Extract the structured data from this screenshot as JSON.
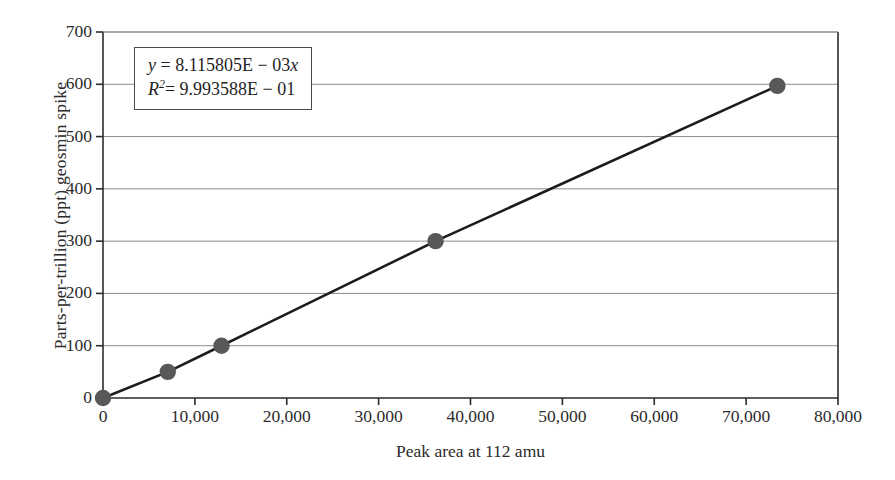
{
  "chart_data": {
    "type": "scatter",
    "title": "",
    "subtitle": "",
    "xlabel": "Peak area at 112 amu",
    "ylabel": "Parts-per-trillion (ppt) geosmin spike",
    "xlim": [
      0,
      80000
    ],
    "ylim": [
      0,
      700
    ],
    "x_ticks": [
      0,
      10000,
      20000,
      30000,
      40000,
      50000,
      60000,
      70000,
      80000
    ],
    "x_tick_labels": [
      "0",
      "10,000",
      "20,000",
      "30,000",
      "40,000",
      "50,000",
      "60,000",
      "70,000",
      "80,000"
    ],
    "y_ticks": [
      0,
      100,
      200,
      300,
      400,
      500,
      600,
      700
    ],
    "y_tick_labels": [
      "0",
      "100",
      "200",
      "300",
      "400",
      "500",
      "600",
      "700"
    ],
    "grid": "horizontal",
    "legend": "none",
    "series": [
      {
        "name": "Geosmin calibration",
        "marker": "circle",
        "marker_color": "#585858",
        "line_color": "#1c1c1c",
        "x": [
          0,
          7050,
          12900,
          36200,
          73400
        ],
        "y": [
          0,
          50,
          100,
          300,
          597
        ],
        "points": [
          {
            "x": 0,
            "y": 0
          },
          {
            "x": 7050,
            "y": 50
          },
          {
            "x": 12900,
            "y": 100
          },
          {
            "x": 36200,
            "y": 300
          },
          {
            "x": 73400,
            "y": 597
          }
        ]
      }
    ],
    "trendline": {
      "slope": 0.008115805,
      "intercept": 0,
      "equation_text": "y = 8.115805E − 03x",
      "r_squared_text": "R² = 9.993588E − 01",
      "r_squared_value": 0.9993588
    },
    "annotation": {
      "equation_y": "y",
      "equation_eq": "= 8.115805E − 03",
      "equation_x": "x",
      "rsq_r": "R",
      "rsq_exp": "2",
      "rsq_value": "= 9.993588E − 01"
    }
  },
  "colors": {
    "axis": "#2b2b2b",
    "grid": "#8c8c8c",
    "marker": "#585858",
    "line": "#1c1c1c",
    "background": "#ffffff",
    "box_border": "#4a4a4a"
  }
}
